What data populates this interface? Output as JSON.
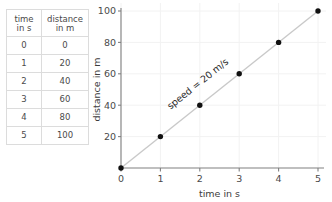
{
  "table": {
    "headers": [
      {
        "line1": "time",
        "line2": "in s"
      },
      {
        "line1": "distance",
        "line2": "in m"
      }
    ],
    "rows": [
      {
        "time": "0",
        "distance": "0"
      },
      {
        "time": "1",
        "distance": "20"
      },
      {
        "time": "2",
        "distance": "40"
      },
      {
        "time": "3",
        "distance": "60"
      },
      {
        "time": "4",
        "distance": "80"
      },
      {
        "time": "5",
        "distance": "100"
      }
    ]
  },
  "chart_data": {
    "type": "scatter",
    "title": "",
    "xlabel": "time in s",
    "ylabel": "distance in m",
    "x": [
      0,
      1,
      2,
      3,
      4,
      5
    ],
    "values": [
      0,
      20,
      40,
      60,
      80,
      100
    ],
    "series": [
      {
        "name": "distance",
        "values": [
          0,
          20,
          40,
          60,
          80,
          100
        ]
      }
    ],
    "xticks": [
      "0",
      "1",
      "2",
      "3",
      "4",
      "5"
    ],
    "yticks": [
      "20",
      "40",
      "60",
      "80",
      "100"
    ],
    "xlim": [
      0,
      5
    ],
    "ylim": [
      0,
      100
    ],
    "grid": true,
    "legend": "none",
    "annotations": [
      {
        "text": "speed = 20 m/s",
        "x": 2.0,
        "y": 52
      }
    ],
    "colors": {
      "point": "#111111",
      "line": "#c9c9c9",
      "axis": "#808080",
      "grid": "#f2f2f2",
      "text": "#4a4a4a"
    }
  }
}
